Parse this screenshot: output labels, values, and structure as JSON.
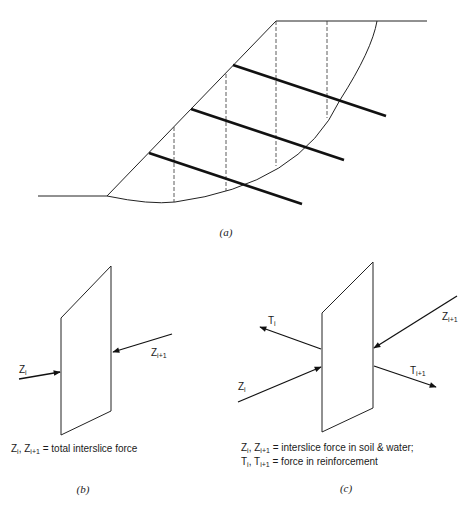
{
  "figure": {
    "panel_a": {
      "caption": "(a)",
      "description": "Slope with circular slip surface, vertical slice boundaries (dashed) and three reinforcement layers (thick lines)"
    },
    "panel_b": {
      "caption": "(b)",
      "labels": {
        "zi_main": "Z",
        "zi_sub": "i",
        "zi1_main": "Z",
        "zi1_sub": "i+1"
      },
      "legend": {
        "z_main": "Z",
        "z_sub": "i",
        "sep": ", ",
        "z1_main": "Z",
        "z1_sub": "i+1",
        "text": " = total interslice force"
      }
    },
    "panel_c": {
      "caption": "(c)",
      "labels": {
        "ti_main": "T",
        "ti_sub": "i",
        "ti1_main": "T",
        "ti1_sub": "i+1",
        "zi_main": "Z",
        "zi_sub": "i",
        "zi1_main": "Z",
        "zi1_sub": "i+1"
      },
      "legend_line1": {
        "z_main": "Z",
        "z_sub": "i",
        "sep": ", ",
        "z1_main": "Z",
        "z1_sub": "i+1",
        "text": " = interslice force in soil & water;"
      },
      "legend_line2": {
        "t_main": "T",
        "t_sub": "i",
        "sep": ", ",
        "t1_main": "T",
        "t1_sub": "i+1",
        "text": " = force in reinforcement"
      }
    }
  }
}
